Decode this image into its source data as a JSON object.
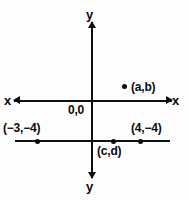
{
  "figure": {
    "background_color": "#fdfdfd",
    "ink_color": "#0a0a0a"
  },
  "axes": {
    "x_label_left": "x",
    "x_label_right": "x",
    "y_label_top": "y",
    "y_label_bottom": "y",
    "origin_label": "0,0"
  },
  "points": [
    {
      "id": "ab",
      "label": "(a,b)",
      "marker": "dot"
    },
    {
      "id": "m3m4",
      "label": "(−3,−4)",
      "marker": "dot"
    },
    {
      "id": "cd",
      "label": "(c,d)",
      "marker": "dot"
    },
    {
      "id": "4m4",
      "label": "(4,−4)",
      "marker": "dot"
    }
  ],
  "chart_data": {
    "type": "scatter",
    "title": "",
    "xlabel": "x",
    "ylabel": "y",
    "grid": false,
    "legend": null,
    "xlim": [
      -8,
      8
    ],
    "ylim": [
      -8,
      8
    ],
    "origin_label": "0,0",
    "annotations": [
      {
        "text": "x",
        "position": "left-end-of-x-axis"
      },
      {
        "text": "x",
        "position": "right-end-of-x-axis"
      },
      {
        "text": "y",
        "position": "top-end-of-y-axis"
      },
      {
        "text": "y",
        "position": "bottom-end-of-y-axis"
      },
      {
        "text": "0,0",
        "position": "origin-lower-left"
      }
    ],
    "reference_lines": [
      {
        "orientation": "horizontal",
        "value": -4,
        "label": ""
      }
    ],
    "points": [
      {
        "label": "(a,b)",
        "x": 4,
        "y": 1.5
      },
      {
        "label": "(−3,−4)",
        "x": -3,
        "y": -4
      },
      {
        "label": "(c,d)",
        "x": 1,
        "y": -4
      },
      {
        "label": "(4,−4)",
        "x": 4,
        "y": -4
      }
    ]
  }
}
